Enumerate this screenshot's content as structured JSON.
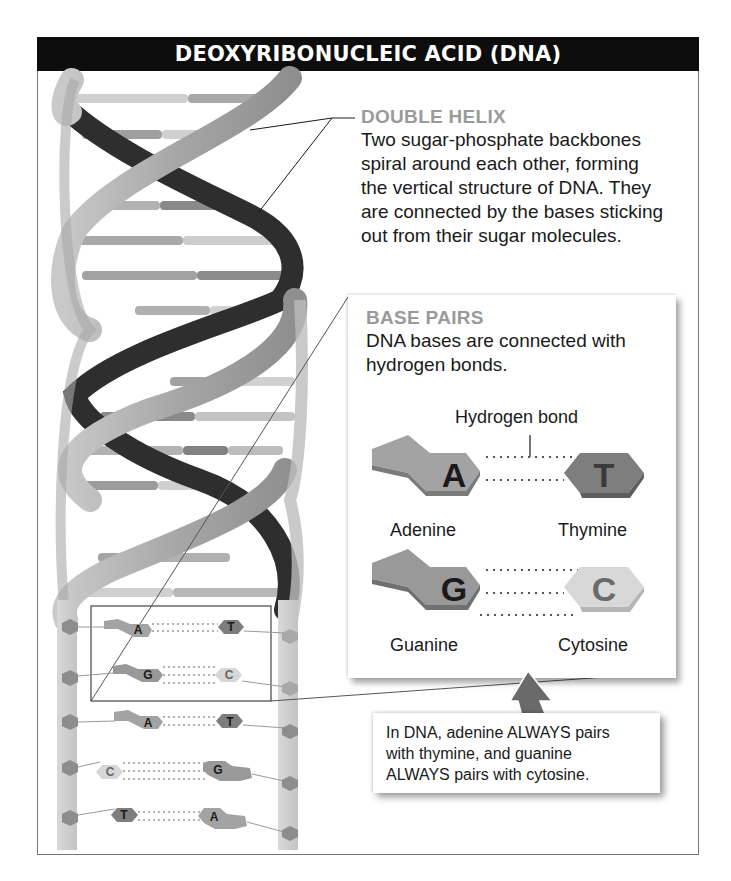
{
  "header": {
    "title": "DEOXYRIBONUCLEIC ACID (DNA)"
  },
  "double_helix": {
    "heading": "DOUBLE HELIX",
    "lines": [
      "Two sugar-phosphate backbones",
      "spiral around each other, forming",
      "the vertical structure of DNA. They",
      "are connected by the bases sticking",
      "out from their sugar molecules."
    ]
  },
  "base_pairs": {
    "heading": "BASE PAIRS",
    "lines": [
      "DNA bases are connected with",
      "hydrogen bonds."
    ],
    "hydrogen_bond_label": "Hydrogen bond",
    "pairs": [
      {
        "left": {
          "letter": "A",
          "name": "Adenine"
        },
        "right": {
          "letter": "T",
          "name": "Thymine"
        },
        "bonds": 2
      },
      {
        "left": {
          "letter": "G",
          "name": "Guanine"
        },
        "right": {
          "letter": "C",
          "name": "Cytosine"
        },
        "bonds": 3
      }
    ]
  },
  "ladder": {
    "rungs": [
      {
        "left": "A",
        "right": "T"
      },
      {
        "left": "G",
        "right": "C"
      },
      {
        "left": "A",
        "right": "T"
      },
      {
        "left": "C",
        "right": "G"
      },
      {
        "left": "T",
        "right": "A"
      }
    ]
  },
  "callout": {
    "lines": [
      "In DNA, adenine ALWAYS pairs",
      "with thymine, and guanine",
      "ALWAYS pairs with cytosine."
    ]
  },
  "colors": {
    "header_bg": "#0d0d0d",
    "header_text": "#ffffff",
    "heading_gray": "#9a9a9a",
    "backbone_light": "#a8a8a8",
    "backbone_dark": "#2e2e2e",
    "adenine": "#a3a3a3",
    "thymine": "#7e7e7e",
    "guanine": "#8f8f8f",
    "cytosine": "#d4d4d4"
  }
}
